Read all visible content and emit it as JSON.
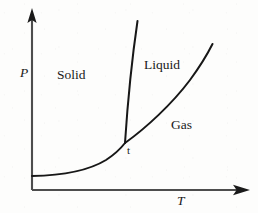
{
  "figure": {
    "kind": "phase-diagram",
    "width": 258,
    "height": 213,
    "background_color": "#fdfdfc",
    "ink_color": "#191919"
  },
  "axes": {
    "y": {
      "label": "P",
      "name": "pressure",
      "italic": true,
      "origin": [
        32,
        190
      ],
      "tip": [
        32,
        10
      ],
      "arrowhead": "up"
    },
    "x": {
      "label": "T",
      "name": "temperature",
      "italic": true,
      "origin": [
        32,
        190
      ],
      "tip": [
        250,
        190
      ],
      "arrowhead": "right"
    }
  },
  "regions": [
    {
      "id": "solid",
      "label": "Solid",
      "label_pos": [
        57,
        68
      ]
    },
    {
      "id": "liquid",
      "label": "Liquid",
      "label_pos": [
        144,
        58
      ]
    },
    {
      "id": "gas",
      "label": "Gas",
      "label_pos": [
        171,
        118
      ]
    }
  ],
  "points": [
    {
      "id": "triple-point",
      "label": "t",
      "at": [
        125,
        143
      ],
      "label_pos": [
        127,
        145
      ]
    }
  ],
  "curves": [
    {
      "id": "sublimation-curve",
      "name": "solid-gas boundary",
      "path": "M 32 176 C 60 175.5, 88 171, 106 160 C 116 153.5, 121.5 147.5, 125 143"
    },
    {
      "id": "fusion-curve",
      "name": "solid-liquid boundary",
      "path": "M 125 143 C 126.5 120, 130 72, 137.5 21"
    },
    {
      "id": "vaporization-curve",
      "name": "liquid-gas boundary",
      "path": "M 125 143 C 146 128, 172 104, 190 80 C 201 65, 208 53, 212.5 44"
    }
  ],
  "chart_data": {
    "type": "line",
    "title": "",
    "xlabel": "T",
    "ylabel": "P",
    "grid": false,
    "legend": null,
    "annotations": [
      "Solid",
      "Liquid",
      "Gas",
      "t"
    ],
    "series": [
      {
        "name": "sublimation-curve",
        "x": [
          32,
          60,
          88,
          106,
          116,
          125
        ],
        "y": [
          176,
          175.5,
          171,
          160,
          153.5,
          143
        ]
      },
      {
        "name": "fusion-curve",
        "x": [
          125,
          127,
          130,
          133,
          137.5
        ],
        "y": [
          143,
          120,
          90,
          55,
          21
        ]
      },
      {
        "name": "vaporization-curve",
        "x": [
          125,
          146,
          172,
          190,
          201,
          212.5
        ],
        "y": [
          143,
          128,
          104,
          80,
          65,
          44
        ]
      }
    ]
  }
}
